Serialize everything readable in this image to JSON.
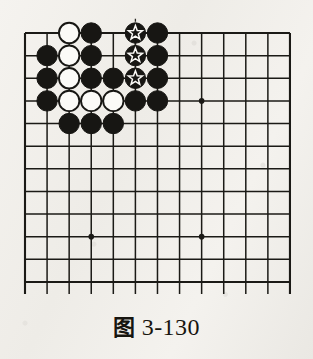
{
  "figure": {
    "caption_cjk": "图",
    "caption_number": "3-130",
    "caption_full": "图 3-130"
  },
  "board": {
    "type": "go-board-diagram",
    "columns": 13,
    "rows": 12,
    "origin_x": 25,
    "origin_y": 33,
    "col_spacing": 22.08,
    "row_spacing": 22.63,
    "stone_radius": 10.2,
    "line_color": "#1b1a16",
    "black_stone_color": "#171613",
    "white_stone_color": "#fbfaf7",
    "white_stone_border": "#171613",
    "marker_color": "#fbfaf7",
    "bottom_edge_cut": true,
    "bottom_stub_length": 12,
    "hoshi": [
      {
        "col": 9,
        "row": 4
      },
      {
        "col": 4,
        "row": 10
      },
      {
        "col": 9,
        "row": 10
      }
    ],
    "stones": [
      {
        "col": 3,
        "row": 1,
        "color": "white",
        "marker": "none"
      },
      {
        "col": 4,
        "row": 1,
        "color": "black",
        "marker": "none"
      },
      {
        "col": 6,
        "row": 1,
        "color": "black",
        "marker": "star"
      },
      {
        "col": 7,
        "row": 1,
        "color": "black",
        "marker": "none"
      },
      {
        "col": 2,
        "row": 2,
        "color": "black",
        "marker": "none"
      },
      {
        "col": 3,
        "row": 2,
        "color": "white",
        "marker": "none"
      },
      {
        "col": 4,
        "row": 2,
        "color": "black",
        "marker": "none"
      },
      {
        "col": 6,
        "row": 2,
        "color": "black",
        "marker": "star"
      },
      {
        "col": 7,
        "row": 2,
        "color": "black",
        "marker": "none"
      },
      {
        "col": 2,
        "row": 3,
        "color": "black",
        "marker": "none"
      },
      {
        "col": 3,
        "row": 3,
        "color": "white",
        "marker": "none"
      },
      {
        "col": 4,
        "row": 3,
        "color": "black",
        "marker": "none"
      },
      {
        "col": 5,
        "row": 3,
        "color": "black",
        "marker": "none"
      },
      {
        "col": 6,
        "row": 3,
        "color": "black",
        "marker": "star"
      },
      {
        "col": 7,
        "row": 3,
        "color": "black",
        "marker": "none"
      },
      {
        "col": 2,
        "row": 4,
        "color": "black",
        "marker": "none"
      },
      {
        "col": 3,
        "row": 4,
        "color": "white",
        "marker": "none"
      },
      {
        "col": 4,
        "row": 4,
        "color": "white",
        "marker": "none"
      },
      {
        "col": 5,
        "row": 4,
        "color": "white",
        "marker": "none"
      },
      {
        "col": 6,
        "row": 4,
        "color": "black",
        "marker": "none"
      },
      {
        "col": 7,
        "row": 4,
        "color": "black",
        "marker": "none"
      },
      {
        "col": 3,
        "row": 5,
        "color": "black",
        "marker": "none"
      },
      {
        "col": 4,
        "row": 5,
        "color": "black",
        "marker": "none"
      },
      {
        "col": 5,
        "row": 5,
        "color": "black",
        "marker": "none"
      }
    ],
    "dashed_connector": {
      "col": 6,
      "row_start": 1,
      "row_end": 3,
      "color": "#2a2823",
      "dash": "3 3"
    }
  }
}
